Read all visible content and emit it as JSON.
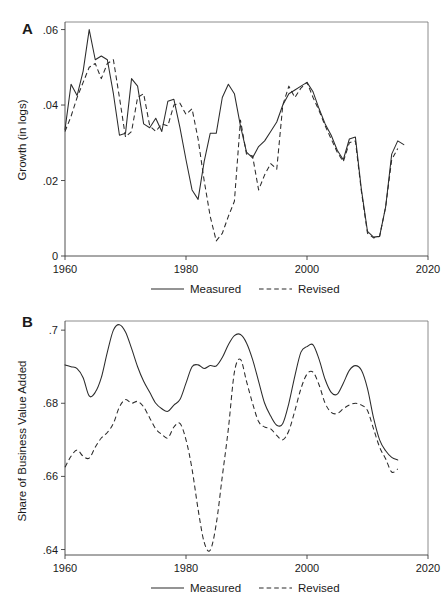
{
  "figure": {
    "background": "#ffffff",
    "line_color": "#2b2b2b",
    "axis_color": "#3d3d3d"
  },
  "panel_a": {
    "letter": "A",
    "ylabel": "Growth (in logs)",
    "ytick_labels": [
      "0",
      ".02",
      ".04",
      ".06"
    ],
    "xtick_labels": [
      "1960",
      "1980",
      "2000",
      "2020"
    ],
    "legend": {
      "measured": "Measured",
      "revised": "Revised"
    }
  },
  "panel_b": {
    "letter": "B",
    "ylabel": "Share of Business Value Added",
    "ytick_labels": [
      ".64",
      ".66",
      ".68",
      ".7"
    ],
    "xtick_labels": [
      "1960",
      "1980",
      "2000",
      "2020"
    ],
    "legend": {
      "measured": "Measured",
      "revised": "Revised"
    }
  },
  "chart_data": [
    {
      "type": "line",
      "panel": "A",
      "title": "",
      "xlabel": "",
      "ylabel": "Growth (in logs)",
      "xlim": [
        1960,
        2020
      ],
      "ylim": [
        0,
        0.062
      ],
      "xticks": [
        1960,
        1980,
        2000,
        2020
      ],
      "yticks": [
        0,
        0.02,
        0.04,
        0.06
      ],
      "grid": false,
      "legend_position": "above-and-below",
      "series": [
        {
          "name": "Measured",
          "style": "solid",
          "x": [
            1960,
            1961,
            1962,
            1963,
            1964,
            1965,
            1966,
            1967,
            1968,
            1969,
            1970,
            1971,
            1972,
            1973,
            1974,
            1975,
            1976,
            1977,
            1978,
            1979,
            1980,
            1981,
            1982,
            1983,
            1984,
            1985,
            1986,
            1987,
            1988,
            1989,
            1990,
            1991,
            1992,
            1993,
            1994,
            1995,
            1996,
            1997,
            1998,
            1999,
            2000,
            2001,
            2002,
            2003,
            2004,
            2005,
            2006,
            2007,
            2008,
            2009,
            2010,
            2011,
            2012,
            2013,
            2014,
            2015,
            2016
          ],
          "y": [
            0.0335,
            0.0455,
            0.0425,
            0.049,
            0.06,
            0.052,
            0.053,
            0.052,
            0.043,
            0.032,
            0.0325,
            0.047,
            0.045,
            0.035,
            0.034,
            0.0365,
            0.033,
            0.041,
            0.0415,
            0.034,
            0.0255,
            0.0175,
            0.015,
            0.025,
            0.0325,
            0.0325,
            0.042,
            0.0455,
            0.043,
            0.0345,
            0.0275,
            0.026,
            0.029,
            0.0305,
            0.033,
            0.0355,
            0.04,
            0.043,
            0.044,
            0.045,
            0.046,
            0.0435,
            0.039,
            0.035,
            0.032,
            0.028,
            0.0255,
            0.031,
            0.0315,
            0.0175,
            0.0065,
            0.005,
            0.0052,
            0.013,
            0.027,
            0.0305,
            0.0295
          ],
          "value_range": [
            0.005,
            0.06
          ]
        },
        {
          "name": "Revised",
          "style": "dashed",
          "x": [
            1960,
            1961,
            1962,
            1963,
            1964,
            1965,
            1966,
            1967,
            1968,
            1969,
            1970,
            1971,
            1972,
            1973,
            1974,
            1975,
            1976,
            1977,
            1978,
            1979,
            1980,
            1981,
            1982,
            1983,
            1984,
            1985,
            1986,
            1987,
            1988,
            1989,
            1990,
            1991,
            1992,
            1993,
            1994,
            1995,
            1996,
            1997,
            1998,
            1999,
            2000,
            2001,
            2002,
            2003,
            2004,
            2005,
            2006,
            2007,
            2008,
            2009,
            2010,
            2011,
            2012,
            2013,
            2014,
            2015
          ],
          "y": [
            0.033,
            0.037,
            0.042,
            0.046,
            0.05,
            0.051,
            0.047,
            0.051,
            0.052,
            0.042,
            0.0315,
            0.033,
            0.042,
            0.043,
            0.0345,
            0.033,
            0.035,
            0.0345,
            0.04,
            0.0405,
            0.0375,
            0.039,
            0.031,
            0.02,
            0.0105,
            0.004,
            0.006,
            0.0105,
            0.0145,
            0.036,
            0.027,
            0.0265,
            0.0175,
            0.0215,
            0.0245,
            0.023,
            0.04,
            0.045,
            0.042,
            0.0445,
            0.046,
            0.042,
            0.0385,
            0.0345,
            0.031,
            0.0275,
            0.025,
            0.03,
            0.0305,
            0.017,
            0.006,
            0.0048,
            0.0052,
            0.013,
            0.0255,
            0.0285
          ],
          "value_range": [
            0.004,
            0.052
          ]
        }
      ]
    },
    {
      "type": "line",
      "panel": "B",
      "title": "",
      "xlabel": "",
      "ylabel": "Share of Business Value Added",
      "xlim": [
        1960,
        2020
      ],
      "ylim": [
        0.6385,
        0.7025
      ],
      "xticks": [
        1960,
        1980,
        2000,
        2020
      ],
      "yticks": [
        0.64,
        0.66,
        0.68,
        0.7
      ],
      "grid": false,
      "legend_position": "above-and-below",
      "series": [
        {
          "name": "Measured",
          "style": "solid",
          "x": [
            1960,
            1961,
            1962,
            1963,
            1964,
            1965,
            1966,
            1967,
            1968,
            1969,
            1970,
            1971,
            1972,
            1973,
            1974,
            1975,
            1976,
            1977,
            1978,
            1979,
            1980,
            1981,
            1982,
            1983,
            1984,
            1985,
            1986,
            1987,
            1988,
            1989,
            1990,
            1991,
            1992,
            1993,
            1994,
            1995,
            1996,
            1997,
            1998,
            1999,
            2000,
            2001,
            2002,
            2003,
            2004,
            2005,
            2006,
            2007,
            2008,
            2009,
            2010,
            2011,
            2012,
            2013,
            2014,
            2015
          ],
          "y": [
            0.6905,
            0.69,
            0.6895,
            0.687,
            0.682,
            0.683,
            0.687,
            0.694,
            0.7,
            0.7015,
            0.6995,
            0.695,
            0.69,
            0.686,
            0.683,
            0.68,
            0.6785,
            0.6778,
            0.6795,
            0.681,
            0.6855,
            0.69,
            0.6905,
            0.6895,
            0.6903,
            0.6902,
            0.6925,
            0.696,
            0.6985,
            0.6988,
            0.6965,
            0.692,
            0.686,
            0.68,
            0.6765,
            0.674,
            0.6745,
            0.68,
            0.6875,
            0.694,
            0.6955,
            0.696,
            0.692,
            0.6865,
            0.683,
            0.6825,
            0.6855,
            0.689,
            0.6903,
            0.689,
            0.684,
            0.676,
            0.67,
            0.667,
            0.6652,
            0.6645
          ],
          "value_range": [
            0.6645,
            0.7015
          ]
        },
        {
          "name": "Revised",
          "style": "dashed",
          "x": [
            1960,
            1961,
            1962,
            1963,
            1964,
            1965,
            1966,
            1967,
            1968,
            1969,
            1970,
            1971,
            1972,
            1973,
            1974,
            1975,
            1976,
            1977,
            1978,
            1979,
            1980,
            1981,
            1982,
            1983,
            1984,
            1985,
            1986,
            1987,
            1988,
            1989,
            1990,
            1991,
            1992,
            1993,
            1994,
            1995,
            1996,
            1997,
            1998,
            1999,
            2000,
            2001,
            2002,
            2003,
            2004,
            2005,
            2006,
            2007,
            2008,
            2009,
            2010,
            2011,
            2012,
            2013,
            2014,
            2015
          ],
          "y": [
            0.6625,
            0.6655,
            0.6672,
            0.6655,
            0.665,
            0.668,
            0.6705,
            0.672,
            0.6745,
            0.679,
            0.681,
            0.68,
            0.6805,
            0.679,
            0.676,
            0.673,
            0.6715,
            0.6705,
            0.6735,
            0.6745,
            0.67,
            0.662,
            0.651,
            0.642,
            0.6398,
            0.647,
            0.66,
            0.673,
            0.6885,
            0.692,
            0.686,
            0.68,
            0.675,
            0.6735,
            0.673,
            0.6712,
            0.67,
            0.6725,
            0.678,
            0.684,
            0.688,
            0.6885,
            0.685,
            0.68,
            0.6775,
            0.6772,
            0.6785,
            0.6795,
            0.68,
            0.6795,
            0.678,
            0.673,
            0.668,
            0.6648,
            0.6612,
            0.662
          ],
          "value_range": [
            0.6398,
            0.692
          ]
        }
      ]
    }
  ]
}
